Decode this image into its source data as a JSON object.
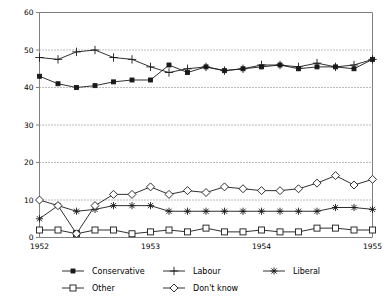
{
  "chart_data": {
    "type": "line",
    "title": "",
    "xlabel": "",
    "ylabel": "",
    "ylim": [
      0,
      60
    ],
    "ytick_labels": [
      "0",
      "10",
      "20",
      "30",
      "40",
      "50",
      "60"
    ],
    "yticks": [
      0,
      10,
      20,
      30,
      40,
      50,
      60
    ],
    "grid": true,
    "grid_style": "dotted horizontal",
    "xtick_labels": [
      "1952",
      "1953",
      "1954",
      "1955"
    ],
    "xticks": [
      0,
      6,
      12,
      18
    ],
    "x": [
      0,
      1,
      2,
      3,
      4,
      5,
      6,
      7,
      8,
      9,
      10,
      11,
      12,
      13,
      14,
      15,
      16,
      17,
      18
    ],
    "legend_position": "bottom",
    "series": [
      {
        "name": "Conservative",
        "marker": "filled-square",
        "values": [
          43,
          41,
          40,
          40.5,
          41.5,
          42,
          42,
          46,
          44,
          45.5,
          44.5,
          45,
          45.5,
          46,
          45,
          45.5,
          45.5,
          45,
          47.5
        ]
      },
      {
        "name": "Labour",
        "marker": "plus",
        "values": [
          48,
          47.5,
          49.5,
          50,
          48,
          47.5,
          45.5,
          44,
          45,
          45.5,
          44.5,
          45,
          46,
          46,
          45.5,
          46.5,
          45.5,
          46,
          47.5
        ]
      },
      {
        "name": "Liberal",
        "marker": "asterisk",
        "values": [
          5,
          8.5,
          7,
          7.5,
          8.5,
          8.5,
          8.5,
          7,
          7,
          7,
          7,
          7,
          7,
          7,
          7,
          7,
          8,
          8,
          7.5
        ]
      },
      {
        "name": "Other",
        "marker": "open-square",
        "values": [
          2,
          2,
          1,
          2,
          2,
          1,
          1.5,
          2,
          1.5,
          2.5,
          1.5,
          1.5,
          2,
          1.5,
          1.5,
          2.5,
          2.5,
          2,
          2
        ]
      },
      {
        "name": "Don't know",
        "marker": "open-diamond",
        "values": [
          10,
          8.5,
          1,
          8.5,
          11.5,
          11.5,
          13.5,
          11.5,
          12.5,
          12,
          13.5,
          13,
          12.5,
          12.5,
          13,
          14.5,
          16.5,
          14,
          15.5
        ]
      }
    ]
  },
  "legend": {
    "items": [
      {
        "label": "Conservative",
        "marker": "filled-square"
      },
      {
        "label": "Labour",
        "marker": "plus"
      },
      {
        "label": "Liberal",
        "marker": "asterisk"
      },
      {
        "label": "Other",
        "marker": "open-square"
      },
      {
        "label": "Don't know",
        "marker": "open-diamond"
      }
    ]
  },
  "colors": {
    "line": "#1a1a1a",
    "axis": "#808080",
    "grid": "#555555",
    "background": "#ffffff"
  }
}
